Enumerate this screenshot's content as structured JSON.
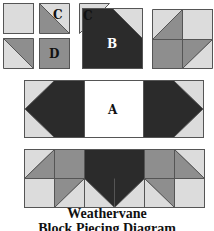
{
  "colors": {
    "light": "#dcdcdc",
    "medium": "#8e8e8e",
    "dark": "#2b2b2b",
    "white": "#ffffff",
    "stroke": "#555555"
  },
  "units": {
    "plain_square": {
      "label": ""
    },
    "hst_c": {
      "label": "C"
    },
    "hst_plain": {
      "label": ""
    },
    "square_d": {
      "label": "D"
    },
    "triangle_c": {
      "label": "C"
    },
    "flying_goose_b": {
      "label": "B"
    },
    "four_patch": {
      "label": ""
    }
  },
  "row_a": {
    "center_label": "A"
  },
  "title": {
    "line1": "Weathervane",
    "line2": "Block Piecing Diagram"
  }
}
